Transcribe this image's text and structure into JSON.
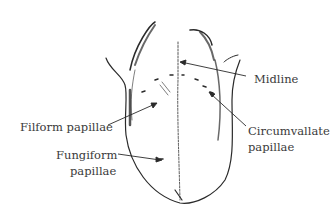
{
  "diagram": {
    "labels": {
      "midline": "Midline",
      "filiform": "Filform papillae",
      "fungiform_1": "Fungiform",
      "fungiform_2": "papillae",
      "circumvallate_1": "Circumvallate",
      "circumvallate_2": "papillae"
    },
    "colors": {
      "ink": "#2a2a2a",
      "text": "#3a3a3a",
      "background": "#ffffff"
    }
  }
}
